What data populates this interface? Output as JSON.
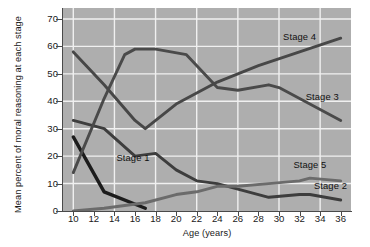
{
  "chart_data": {
    "type": "line",
    "title": "",
    "xlabel": "Age (years)",
    "ylabel": "Mean percent of moral reasoning at each stage",
    "xlim": [
      9,
      37
    ],
    "ylim": [
      0,
      74
    ],
    "xticks": [
      10,
      12,
      14,
      16,
      18,
      20,
      22,
      24,
      26,
      28,
      30,
      32,
      34,
      36
    ],
    "yticks": [
      0,
      10,
      20,
      30,
      40,
      50,
      60,
      70
    ],
    "grid": true,
    "legend_position": "inline-annotations",
    "plot_background": "#aeaeae",
    "gridline_color": "#f0f0f0",
    "series": [
      {
        "name": "Stage 1",
        "label": "Stage 1",
        "color": "#1c1c1c",
        "width": 3.4,
        "label_x": 14.2,
        "label_y": 19.5,
        "x": [
          10,
          13,
          17
        ],
        "y": [
          27,
          7,
          1
        ]
      },
      {
        "name": "Stage 2",
        "label": "Stage 2",
        "color": "#3d3d3d",
        "width": 2.9,
        "label_x": 33.4,
        "label_y": 9.2,
        "x": [
          10,
          13,
          16,
          18,
          20,
          22,
          24,
          26,
          29,
          32,
          33,
          36
        ],
        "y": [
          33,
          30,
          20,
          21,
          15,
          11,
          10,
          8,
          5,
          6,
          6,
          4
        ]
      },
      {
        "name": "Stage 3",
        "label": "Stage 3",
        "color": "#4a4a4a",
        "width": 2.9,
        "label_x": 32.6,
        "label_y": 41.5,
        "x": [
          10,
          13,
          15,
          16,
          18,
          21,
          24,
          26,
          29,
          30,
          33,
          36
        ],
        "y": [
          14,
          41,
          57,
          59,
          59,
          57,
          45,
          44,
          46,
          45,
          39,
          33
        ]
      },
      {
        "name": "Stage 4",
        "label": "Stage 4",
        "color": "#474747",
        "width": 2.9,
        "label_x": 30.4,
        "label_y": 63.5,
        "x": [
          10,
          13,
          16,
          17,
          20,
          24,
          28,
          32,
          36
        ],
        "y": [
          58,
          46,
          33,
          30,
          39,
          47,
          53,
          58,
          63
        ]
      },
      {
        "name": "Stage 5",
        "label": "Stage 5",
        "color": "#6b6b6b",
        "width": 2.9,
        "label_x": 31.4,
        "label_y": 16.6,
        "x": [
          10,
          13,
          17,
          20,
          22,
          24,
          26,
          29,
          32,
          33,
          36
        ],
        "y": [
          0,
          1,
          3,
          6,
          7,
          9,
          9,
          10,
          11,
          12,
          11
        ]
      }
    ]
  }
}
